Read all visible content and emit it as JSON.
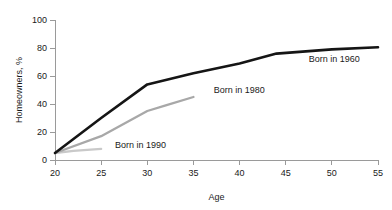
{
  "chart_data": {
    "type": "line",
    "title": "",
    "xlabel": "Age",
    "ylabel": "Homeowners, %",
    "xlim": [
      20,
      55
    ],
    "ylim": [
      0,
      100
    ],
    "xticks": [
      20,
      25,
      30,
      35,
      40,
      45,
      50,
      55
    ],
    "xtick_labels": [
      "20",
      "25",
      "30",
      "35",
      "40",
      "45",
      "50",
      "55"
    ],
    "yticks": [
      0,
      20,
      40,
      60,
      80,
      100
    ],
    "ytick_labels": [
      "0",
      "20",
      "40",
      "60",
      "80",
      "100"
    ],
    "grid": false,
    "legend_position": "inline-labels",
    "series": [
      {
        "name": "Born in 1960",
        "color": "#151515",
        "width": 2.6,
        "x": [
          20,
          25,
          30,
          35,
          40,
          44,
          50,
          55
        ],
        "values": [
          5,
          30,
          54,
          62,
          69,
          76,
          79,
          80.5
        ],
        "label": "Born in 1960",
        "label_x": 47.5,
        "label_y": 72
      },
      {
        "name": "Born in 1980",
        "color": "#a8a8a8",
        "width": 2.3,
        "x": [
          20,
          25,
          30,
          32,
          35
        ],
        "values": [
          5,
          17,
          35,
          39,
          45
        ],
        "label": "Born in 1980",
        "label_x": 37.2,
        "label_y": 50
      },
      {
        "name": "Born in 1990",
        "color": "#c9c9c9",
        "width": 2.3,
        "x": [
          20,
          22,
          25
        ],
        "values": [
          5,
          6.5,
          8
        ],
        "label": "Born in 1990",
        "label_x": 26.5,
        "label_y": 11
      }
    ]
  },
  "axis": {
    "x_title": "Age",
    "y_title": "Homeowners, %"
  },
  "colors": {
    "axis": "#9a9a9a",
    "text": "#1a1a1a",
    "background": "#ffffff"
  }
}
